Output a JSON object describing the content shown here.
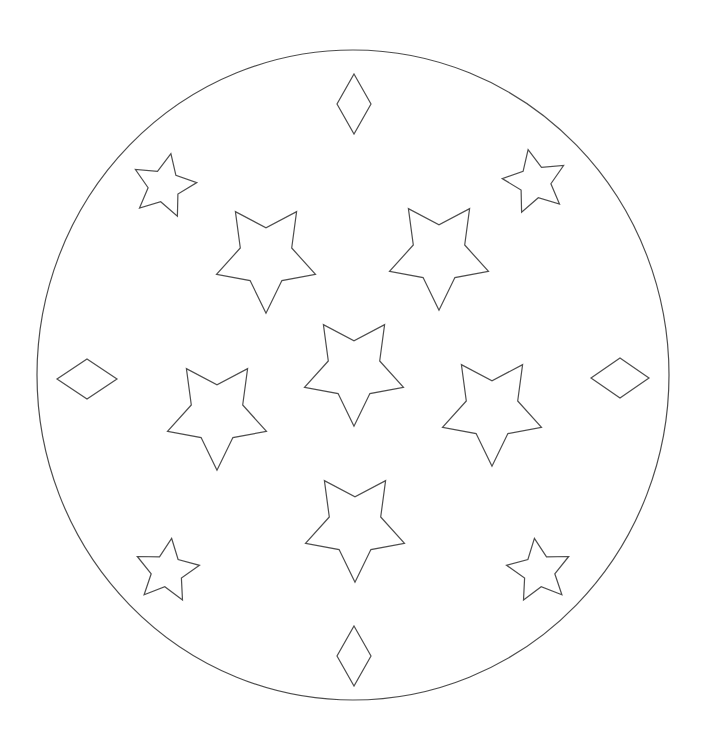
{
  "canvas": {
    "width": 706,
    "height": 745,
    "background": "#ffffff",
    "stroke_color": "#4d4d4d",
    "stroke_width": 1.2
  },
  "figure": {
    "outer_ellipse": {
      "name": "outer-circle",
      "cx": 353,
      "cy": 375,
      "rx": 316,
      "ry": 325
    },
    "medium_stars": {
      "outer_radius": 52,
      "inner_radius": 27,
      "y_scale": 1.08,
      "orientation": "point-down",
      "items": [
        {
          "name": "star-upper-left",
          "cx": 266,
          "cy": 257,
          "rotation": 0
        },
        {
          "name": "star-upper-right",
          "cx": 439,
          "cy": 254,
          "rotation": 0
        },
        {
          "name": "star-center",
          "cx": 354,
          "cy": 370,
          "rotation": 0
        },
        {
          "name": "star-middle-left",
          "cx": 217,
          "cy": 414,
          "rotation": 0
        },
        {
          "name": "star-middle-right",
          "cx": 492,
          "cy": 410,
          "rotation": 0
        },
        {
          "name": "star-lower-center",
          "cx": 355,
          "cy": 526,
          "rotation": 0
        }
      ]
    },
    "small_stars": {
      "outer_radius": 33,
      "inner_radius": 16,
      "y_scale": 1.0,
      "orientation": "point-up",
      "items": [
        {
          "name": "small-star-top-left",
          "cx": 164,
          "cy": 186,
          "rotation": 12
        },
        {
          "name": "small-star-top-right",
          "cx": 535,
          "cy": 182,
          "rotation": -12
        },
        {
          "name": "small-star-bottom-left",
          "cx": 167,
          "cy": 571,
          "rotation": 8
        },
        {
          "name": "small-star-bottom-right",
          "cx": 539,
          "cy": 571,
          "rotation": -8
        }
      ]
    },
    "diamonds": [
      {
        "name": "diamond-top",
        "cx": 354,
        "cy": 104,
        "half_width": 17,
        "half_height": 30
      },
      {
        "name": "diamond-left",
        "cx": 87,
        "cy": 379,
        "half_width": 30,
        "half_height": 20
      },
      {
        "name": "diamond-right",
        "cx": 620,
        "cy": 378,
        "half_width": 29,
        "half_height": 20
      },
      {
        "name": "diamond-bottom",
        "cx": 354,
        "cy": 656,
        "half_width": 17,
        "half_height": 30
      }
    ]
  }
}
